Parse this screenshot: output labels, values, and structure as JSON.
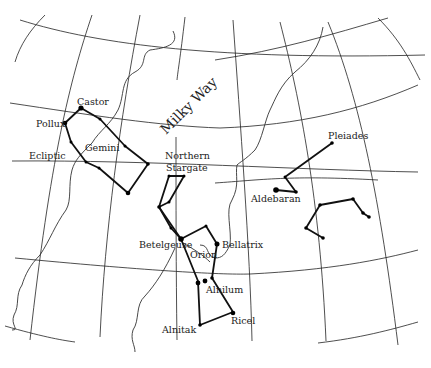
{
  "labels": {
    "milky_way": "Milky Way",
    "castor": "Castor",
    "pollux": "Pollux",
    "gemini": "Gemini",
    "ecliptic": "Ecliptic",
    "northern": "Northern",
    "stargate": "Stargate",
    "pleiades": "Pleiades",
    "aldebaran": "Aldebaran",
    "betelgeuse": "Betelgeuse",
    "bellatrix": "Bellatrix",
    "orion": "Orion",
    "alnilam": "Alnilum",
    "alnitak": "Alnitak",
    "rigel": "Ricel"
  },
  "constellations": [
    "Gemini",
    "Orion",
    "Taurus (Aldebaran, Pleiades)",
    "Northern Stargate"
  ],
  "colors": {
    "ink": "#111111",
    "background": "#ffffff"
  }
}
